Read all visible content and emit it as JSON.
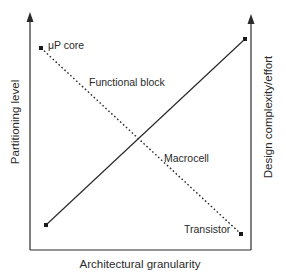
{
  "diagram": {
    "type": "crossing-lines tradeoff diagram",
    "axes": {
      "x_label": "Architectural granularity",
      "y_left_label": "Partitioning level",
      "y_right_label": "Design complexity/effort"
    },
    "series": [
      {
        "name": "Partitioning level",
        "style": "dotted",
        "points": [
          {
            "label": "μP core",
            "x": 41,
            "y": 48
          },
          {
            "label": "Functional block"
          },
          {
            "label": "Macrocell"
          },
          {
            "label": "Transistor",
            "x": 241,
            "y": 234
          }
        ]
      },
      {
        "name": "Design complexity/effort",
        "style": "solid",
        "points": [
          {
            "x": 46,
            "y": 225
          },
          {
            "x": 245,
            "y": 39
          }
        ]
      }
    ],
    "labels": {
      "up_core": "μP core",
      "functional_block": "Functional block",
      "macrocell": "Macrocell",
      "transistor": "Transistor"
    },
    "colors": {
      "line": "#2a2a2a",
      "background": "#ffffff"
    }
  }
}
